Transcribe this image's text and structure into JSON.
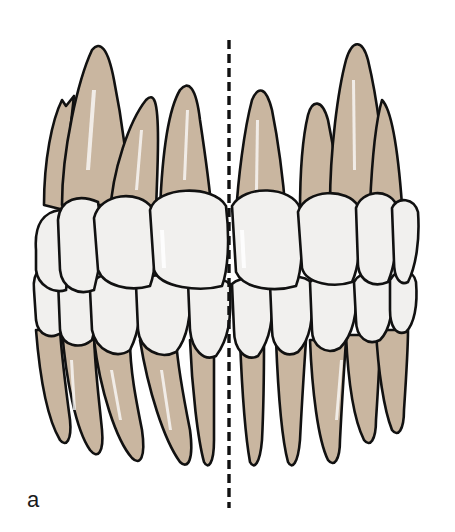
{
  "figure": {
    "panel_label": "a",
    "colors": {
      "root": "#c9b6a0",
      "crown": "#f1f0ee",
      "outline": "#111111",
      "midline": "#111111",
      "highlight": "#ffffff",
      "background": "#ffffff"
    }
  }
}
